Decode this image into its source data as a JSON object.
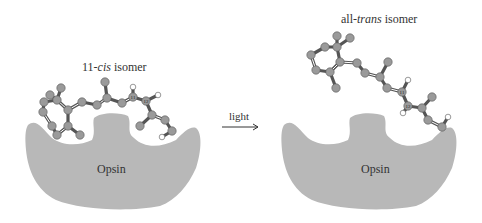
{
  "title_left_prefix": "11-",
  "title_left_italic": "cis",
  "title_left_suffix": " isomer",
  "title_right_prefix": "all-",
  "title_right_italic": "trans",
  "title_right_suffix": " isomer",
  "arrow_label": "light",
  "protein_left_label": "Opsin",
  "protein_right_label": "Opsin",
  "atom_labels": {
    "c11": "11",
    "c12": "12"
  },
  "colors": {
    "protein": "#b8b8b8",
    "carbon": "#9a9a9a",
    "hydrogen": "#ffffff",
    "bond": "#555555",
    "text": "#333333"
  }
}
